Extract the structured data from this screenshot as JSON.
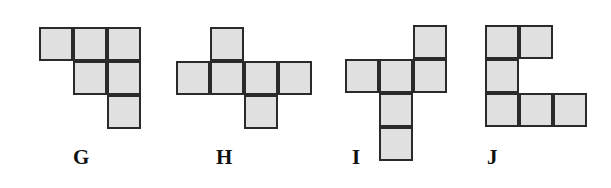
{
  "figure": {
    "cell_size": 34,
    "fill_color": "#e0e0e0",
    "stroke_color": "#2a2a2a",
    "nets": [
      {
        "label": "G",
        "origin": [
          39,
          27
        ],
        "label_pos": [
          73,
          145
        ],
        "cells": [
          [
            0,
            0
          ],
          [
            0,
            1
          ],
          [
            0,
            2
          ],
          [
            1,
            1
          ],
          [
            1,
            2
          ],
          [
            2,
            2
          ]
        ]
      },
      {
        "label": "H",
        "origin": [
          176,
          27
        ],
        "label_pos": [
          216,
          145
        ],
        "cells": [
          [
            0,
            1
          ],
          [
            1,
            0
          ],
          [
            1,
            1
          ],
          [
            1,
            2
          ],
          [
            1,
            3
          ],
          [
            2,
            2
          ]
        ]
      },
      {
        "label": "I",
        "origin": [
          345,
          25
        ],
        "label_pos": [
          352,
          145
        ],
        "cells": [
          [
            0,
            2
          ],
          [
            1,
            0
          ],
          [
            1,
            1
          ],
          [
            1,
            2
          ],
          [
            2,
            1
          ],
          [
            3,
            1
          ]
        ]
      },
      {
        "label": "J",
        "origin": [
          485,
          25
        ],
        "label_pos": [
          487,
          145
        ],
        "cells": [
          [
            0,
            0
          ],
          [
            0,
            1
          ],
          [
            1,
            0
          ],
          [
            2,
            0
          ],
          [
            2,
            1
          ],
          [
            2,
            2
          ]
        ]
      }
    ]
  }
}
